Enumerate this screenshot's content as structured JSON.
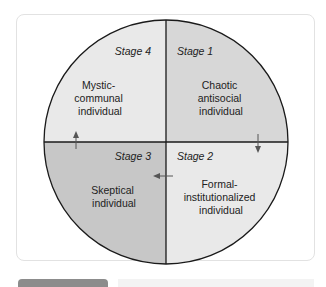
{
  "diagram": {
    "type": "quadrant-circle",
    "colors": {
      "stage4_fill": "#e9e9e9",
      "stage1_fill": "#d7d7d7",
      "stage3_fill": "#c7c7c7",
      "stage2_fill": "#e9e9e9",
      "outline": "#1a1a1a",
      "arrow": "#555555"
    },
    "quadrants": [
      {
        "position": "top-left",
        "stage": "Stage 4",
        "label_lines": [
          "Mystic-",
          "communal",
          "individual"
        ]
      },
      {
        "position": "top-right",
        "stage": "Stage 1",
        "label_lines": [
          "Chaotic",
          "antisocial",
          "individual"
        ]
      },
      {
        "position": "bottom-right",
        "stage": "Stage 2",
        "label_lines": [
          "Formal-",
          "institutionalized",
          "individual"
        ]
      },
      {
        "position": "bottom-left",
        "stage": "Stage 3",
        "label_lines": [
          "Skeptical",
          "individual"
        ]
      }
    ],
    "arrows": [
      {
        "from": "Stage 1",
        "to": "Stage 2",
        "direction": "down"
      },
      {
        "from": "Stage 2",
        "to": "Stage 3",
        "direction": "left"
      },
      {
        "from": "Stage 3",
        "to": "Stage 4",
        "direction": "up"
      }
    ]
  }
}
